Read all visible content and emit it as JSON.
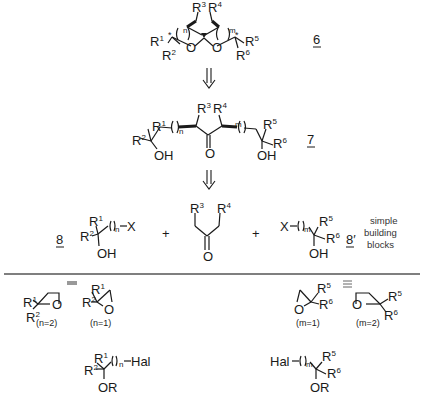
{
  "diagram": {
    "type": "retrosynthetic-scheme",
    "compounds": {
      "spiroketal": {
        "number": "6",
        "substituents": [
          "R1",
          "R2",
          "R3",
          "R4",
          "R5",
          "R6"
        ],
        "ring_indices": [
          "n",
          "m"
        ],
        "atoms": [
          "O",
          "O"
        ]
      },
      "dihydroxy_ketone": {
        "number": "7",
        "substituents": [
          "R1",
          "R2",
          "R3",
          "R4",
          "R5",
          "R6"
        ],
        "ring_indices": [
          "n",
          "m"
        ],
        "groups": [
          "OH",
          "O",
          "OH"
        ]
      },
      "building_block_left": {
        "number": "8",
        "leaving_group": "X",
        "index": "n",
        "group": "OH"
      },
      "ketone": {
        "substituents": [
          "R3",
          "R4"
        ],
        "group": "O"
      },
      "building_block_right": {
        "number": "8'",
        "leaving_group": "X",
        "index": "m",
        "group": "OH"
      }
    },
    "plus_signs": [
      "+",
      "+"
    ],
    "note_lines": [
      "simple",
      "building",
      "blocks"
    ],
    "equivalents_left": [
      {
        "ring": "oxetane",
        "condition": "(n=2)"
      },
      {
        "ring": "epoxide",
        "condition": "(n=1)"
      }
    ],
    "equivalents_right": [
      {
        "ring": "epoxide",
        "condition": "(m=1)"
      },
      {
        "ring": "oxetane",
        "condition": "(m=2)"
      }
    ],
    "protected_halides": [
      {
        "side": "left",
        "halide": "Hal",
        "protecting": "OR",
        "index": "n"
      },
      {
        "side": "right",
        "halide": "Hal",
        "protecting": "OR",
        "index": "m"
      }
    ],
    "equiv_symbol": "≡",
    "retro_arrow": "⇓"
  },
  "labels": {
    "c6": "6",
    "c7": "7",
    "c8": "8",
    "c8p": "8′",
    "R": "R",
    "O": "O",
    "OH": "OH",
    "OR": "OR",
    "X": "X",
    "Hal": "Hal",
    "n": "n",
    "m": "m",
    "s1": "1",
    "s2": "2",
    "s3": "3",
    "s4": "4",
    "s5": "5",
    "s6": "6",
    "plus": "+",
    "note1": "simple",
    "note2": "building",
    "note3": "blocks",
    "n2": "(n=2)",
    "n1": "(n=1)",
    "m1": "(m=1)",
    "m2": "(m=2)",
    "paren_open": "(",
    "paren_close": ")",
    "star": "*"
  }
}
